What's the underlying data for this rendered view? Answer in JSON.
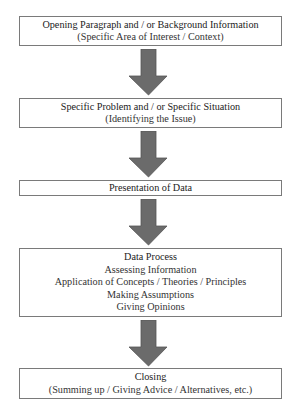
{
  "diagram": {
    "type": "flowchart",
    "direction": "top-to-bottom",
    "colors": {
      "arrow": "#6b6b6b",
      "arrow_edge": "#555555",
      "box_border": "#7a7a7a",
      "text": "#222222"
    },
    "steps": [
      {
        "title": "Opening Paragraph and / or Background Information",
        "lines": [
          "(Specific Area of Interest / Context)"
        ]
      },
      {
        "title": "Specific Problem and / or Specific Situation",
        "lines": [
          "(Identifying the Issue)"
        ]
      },
      {
        "title": "Presentation of Data",
        "lines": []
      },
      {
        "title": "Data Process",
        "lines": [
          "Assessing Information",
          "Application of Concepts / Theories / Principles",
          "Making Assumptions",
          "Giving Opinions"
        ]
      },
      {
        "title": "Closing",
        "lines": [
          "(Summing up / Giving Advice / Alternatives, etc.)"
        ]
      }
    ],
    "arrows": [
      {
        "from": 0,
        "to": 1,
        "icon": "down-arrow-icon"
      },
      {
        "from": 1,
        "to": 2,
        "icon": "down-arrow-icon"
      },
      {
        "from": 2,
        "to": 3,
        "icon": "down-arrow-icon"
      },
      {
        "from": 3,
        "to": 4,
        "icon": "down-arrow-icon"
      }
    ]
  }
}
